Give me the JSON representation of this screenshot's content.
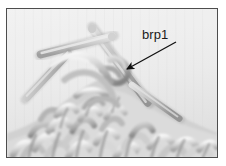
{
  "figure": {
    "type": "photograph",
    "border_color": "#4d4d4d",
    "page_background": "#ffffff",
    "photo_background": "#ececec"
  },
  "annotations": [
    {
      "id": "brp1",
      "label": "brp1",
      "text_color": "#1a1a1a",
      "arrow": {
        "color": "#111111",
        "from_x": 172,
        "from_y": 35,
        "to_x": 120,
        "to_y": 63,
        "direction": "down-left"
      }
    }
  ],
  "photo": {
    "palette": {
      "background_light": "#eeeeee",
      "background_mid": "#e2e2e2",
      "yarn_light": "#f2f2f2",
      "yarn_mid": "#c8c8c8",
      "yarn_dark": "#8f8f8f",
      "yarn_shadow": "#6e6e6e",
      "needle_light": "#dcdcdc",
      "needle_mid": "#b4b4b4",
      "needle_dark": "#949494"
    }
  }
}
